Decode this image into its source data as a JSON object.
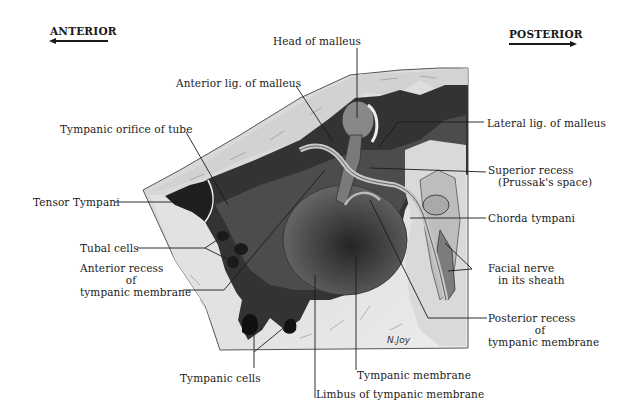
{
  "diagram": {
    "orientation": {
      "anterior": {
        "label": "ANTERIOR",
        "arrow": "left"
      },
      "posterior": {
        "label": "POSTERIOR",
        "arrow": "right"
      }
    },
    "signature": "N.Joy",
    "labels": {
      "head_of_malleus": "Head of malleus",
      "anterior_lig_malleus": "Anterior lig. of malleus",
      "tympanic_orifice_tube": "Tympanic orifice of tube",
      "tensor_tympani": "Tensor Tympani",
      "tubal_cells": "Tubal cells",
      "anterior_recess_1": "Anterior recess",
      "anterior_recess_2": "of",
      "anterior_recess_3": "tympanic membrane",
      "tympanic_cells": "Tympanic cells",
      "limbus": "Limbus of tympanic membrane",
      "tympanic_membrane": "Tympanic membrane",
      "lateral_lig_malleus": "Lateral lig. of malleus",
      "superior_recess_1": "Superior recess",
      "superior_recess_2": "(Prussak's space)",
      "chorda_tympani": "Chorda tympani",
      "facial_nerve_1": "Facial nerve",
      "facial_nerve_2": "in its sheath",
      "posterior_recess_1": "Posterior recess",
      "posterior_recess_2": "of",
      "posterior_recess_3": "tympanic membrane"
    },
    "colors": {
      "background": "#ffffff",
      "bone_light": "#e4e4e4",
      "bone_mid": "#c8c8c8",
      "cavity_dark": "#2e2e2e",
      "membrane": "#5a5a5a",
      "ink": "#1a1a1a"
    }
  }
}
